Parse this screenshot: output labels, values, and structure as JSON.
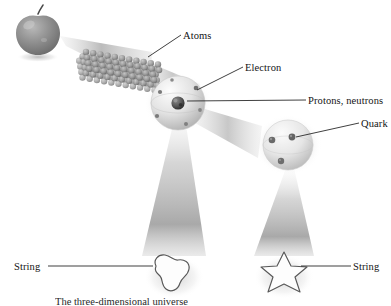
{
  "figure": {
    "background_color": "#ffffff",
    "ink_color": "#141414",
    "caption": "The three-dimensional universe"
  },
  "labels": {
    "atoms": "Atoms",
    "electron": "Electron",
    "protons_neutrons": "Protons, neutrons",
    "quark": "Quark",
    "string_left": "String",
    "string_right": "String"
  },
  "objects": {
    "apple": "apple",
    "atom_lattice": "atom-lattice",
    "atom_sphere": "atom-sphere",
    "nucleus": "nucleus",
    "proton_sphere": "proton-sphere",
    "string_loop_left": "string-loop",
    "string_loop_right": "string-star-loop"
  },
  "chart_data": {
    "type": "diagram",
    "levels": [
      {
        "order": 1,
        "name": "Apple",
        "label": "",
        "shape": "apple",
        "x": 38,
        "y": 30
      },
      {
        "order": 2,
        "name": "Atoms",
        "label": "Atoms",
        "shape": "lattice-of-spheres",
        "x": 118,
        "y": 62
      },
      {
        "order": 3,
        "name": "Electron",
        "label": "Electron",
        "shape": "sphere-with-orbiting-dots",
        "x": 178,
        "y": 103
      },
      {
        "order": 4,
        "name": "Protons, neutrons",
        "label": "Protons, neutrons",
        "shape": "dark-nucleus-cluster",
        "x": 178,
        "y": 103
      },
      {
        "order": 5,
        "name": "Quark",
        "label": "Quark",
        "shape": "sphere-with-three-dots",
        "x": 288,
        "y": 145
      },
      {
        "order": 6,
        "name": "String (left)",
        "label": "String",
        "shape": "closed-loop",
        "x": 172,
        "y": 274
      },
      {
        "order": 7,
        "name": "String (right)",
        "label": "String",
        "shape": "star-loop",
        "x": 282,
        "y": 274
      }
    ],
    "magnification_cones": [
      {
        "from": "apple",
        "to": "atoms",
        "direction": "horizontal-right"
      },
      {
        "from": "atoms",
        "to": "atom-sphere",
        "direction": "horizontal-right"
      },
      {
        "from": "nucleus",
        "to": "proton-sphere",
        "direction": "horizontal-right"
      },
      {
        "from": "nucleus",
        "to": "string-left",
        "direction": "vertical-down"
      },
      {
        "from": "quark",
        "to": "string-right",
        "direction": "vertical-down"
      }
    ],
    "leader_lines": [
      {
        "label": "Atoms",
        "from": [
          181,
          35
        ],
        "to": [
          148,
          56
        ]
      },
      {
        "label": "Electron",
        "from": [
          243,
          67
        ],
        "to": [
          196,
          91
        ]
      },
      {
        "label": "Protons, neutrons",
        "from": [
          306,
          100
        ],
        "to": [
          188,
          100
        ]
      },
      {
        "label": "Quark",
        "from": [
          359,
          123
        ],
        "to": [
          298,
          135
        ]
      },
      {
        "label": "String",
        "from": [
          47,
          266
        ],
        "to": [
          152,
          266
        ]
      },
      {
        "label": "String",
        "from": [
          351,
          266
        ],
        "to": [
          300,
          266
        ]
      }
    ]
  }
}
